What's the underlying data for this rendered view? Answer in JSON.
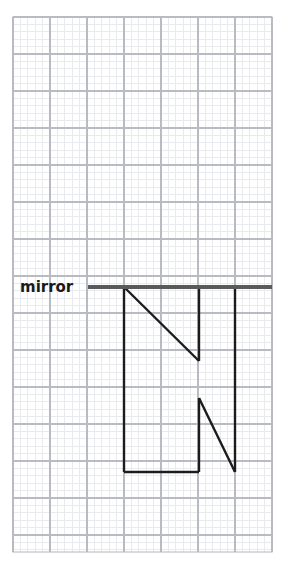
{
  "figure": {
    "kind": "graph-paper-reflection-worksheet",
    "canvas": {
      "width": 287,
      "height": 563,
      "background": "#ffffff"
    },
    "labels": {
      "mirror": "mirror"
    },
    "grid": {
      "x_start": 13,
      "y_start": 17,
      "x_end": 272,
      "y_end": 552,
      "major_spacing": 37,
      "minor_per_major": 5,
      "major_columns": 7,
      "major_rows": 14,
      "major_color": "#b8bcc2",
      "minor_color": "#e8eaee",
      "border_color": "#b8bcc2"
    },
    "mirror_line": {
      "y": 287,
      "x_from": 88,
      "x_to": 272,
      "color": "#5a5a5a",
      "thickness": 4
    },
    "shape": {
      "name": "letter-N-and-reflection",
      "stroke_color": "#1c1c1c",
      "stroke_width": 2.4,
      "reflected_part_points": "124,287 124,472 199,287 199,361 235,287 235,472",
      "upper_left_vertical": "124,287 124,472",
      "upper_diagonal": "124,287 199,361",
      "upper_right_vertical_a": "199,287 199,361",
      "upper_right_vertical_b": "235,287 235,472",
      "upper_top_a": "124,287 199,287",
      "upper_top_b": "199,287 235,287",
      "lower_bottom": "124,472 199,472",
      "lower_inner_vertical": "199,398 199,472",
      "lower_diagonal": "199,398 235,472"
    }
  }
}
